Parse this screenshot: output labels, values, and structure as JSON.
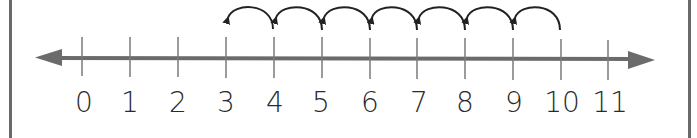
{
  "diagram": {
    "type": "number-line",
    "title": "",
    "axis": {
      "min": 0,
      "max": 11,
      "step": 1,
      "tick_labels": [
        "0",
        "1",
        "2",
        "3",
        "4",
        "5",
        "6",
        "7",
        "8",
        "9",
        "10",
        "11"
      ],
      "arrows": "both",
      "color": "#6b6b6b"
    },
    "hops": {
      "start": 10,
      "end": 3,
      "direction": "left",
      "count": 7,
      "size": 1,
      "color": "#222222",
      "segments": [
        {
          "from": 10,
          "to": 9
        },
        {
          "from": 9,
          "to": 8
        },
        {
          "from": 8,
          "to": 7
        },
        {
          "from": 7,
          "to": 6
        },
        {
          "from": 6,
          "to": 5
        },
        {
          "from": 5,
          "to": 4
        },
        {
          "from": 4,
          "to": 3
        }
      ]
    },
    "frame": {
      "left_border": true,
      "right_border": true,
      "color": "#6a6a6a"
    }
  },
  "labels": {
    "t0": "0",
    "t1": "1",
    "t2": "2",
    "t3": "3",
    "t4": "4",
    "t5": "5",
    "t6": "6",
    "t7": "7",
    "t8": "8",
    "t9": "9",
    "t10": "10",
    "t11": "11"
  }
}
